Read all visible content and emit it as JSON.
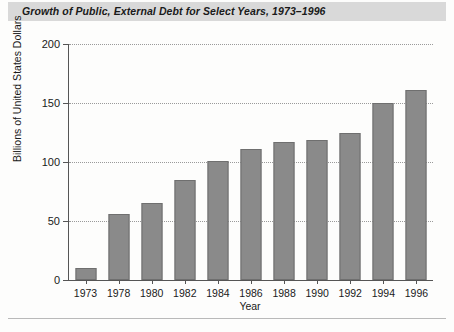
{
  "chart_data": {
    "type": "bar",
    "title": "Growth of Public, External Debt for Select Years, 1973–1996",
    "xlabel": "Year",
    "ylabel": "Billions of United States Dollars",
    "categories": [
      "1973",
      "1978",
      "1980",
      "1982",
      "1984",
      "1986",
      "1988",
      "1990",
      "1992",
      "1994",
      "1996"
    ],
    "values": [
      10,
      56,
      65,
      85,
      101,
      111,
      117,
      119,
      125,
      150,
      161
    ],
    "ylim": [
      0,
      200
    ],
    "yticks": [
      0,
      50,
      100,
      150,
      200
    ],
    "ytick_labels": [
      "0",
      "50",
      "100",
      "150",
      "200"
    ],
    "grid": true,
    "legend": "none",
    "series": [
      {
        "name": "Public, External Debt",
        "values": [
          10,
          56,
          65,
          85,
          101,
          111,
          117,
          119,
          125,
          150,
          161
        ]
      }
    ]
  },
  "colors": {
    "bar_fill": "#8a8a8a",
    "bar_border": "#6f6f6f",
    "title_band": "#d9d9d9",
    "axis": "#555555",
    "grid": "#9a9a9a",
    "text": "#1a1a1a",
    "background": "#fdfdfc"
  }
}
